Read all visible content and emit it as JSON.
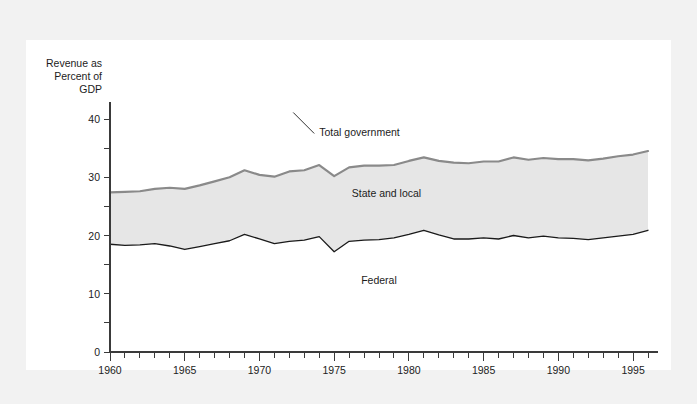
{
  "chart_data": {
    "type": "area",
    "title": "",
    "xlabel": "",
    "ylabel": "Revenue as Percent of GDP",
    "ylabel_lines": [
      "Revenue as",
      "Percent of",
      "GDP"
    ],
    "xlim": [
      1960,
      1996
    ],
    "ylim": [
      0,
      43
    ],
    "grid": false,
    "legend_position": "inline-annotations",
    "y_ticks_major": [
      0,
      10,
      20,
      30,
      40
    ],
    "y_ticks_minor": [
      5,
      15,
      25,
      35
    ],
    "y_tick_labels": [
      "0",
      "10",
      "20",
      "30",
      "40"
    ],
    "x_ticks_major": [
      1960,
      1965,
      1970,
      1975,
      1980,
      1985,
      1990,
      1995
    ],
    "x_tick_labels": [
      "1960",
      "1965",
      "1970",
      "1975",
      "1980",
      "1985",
      "1990",
      "1995"
    ],
    "x_ticks_minor_step": 1,
    "annotations": [
      {
        "text": "Total government",
        "x": 1974.0,
        "y": 37.0
      },
      {
        "text": "State and local",
        "x": 1978.5,
        "y": 26.6
      },
      {
        "text": "Federal",
        "x": 1978.0,
        "y": 11.6
      }
    ],
    "x": [
      1960,
      1961,
      1962,
      1963,
      1964,
      1965,
      1966,
      1967,
      1968,
      1969,
      1970,
      1971,
      1972,
      1973,
      1974,
      1975,
      1976,
      1977,
      1978,
      1979,
      1980,
      1981,
      1982,
      1983,
      1984,
      1985,
      1986,
      1987,
      1988,
      1989,
      1990,
      1991,
      1992,
      1993,
      1994,
      1995,
      1996
    ],
    "series": [
      {
        "name": "Total government",
        "color": "#8a8a8a",
        "values": [
          27.4,
          27.5,
          27.6,
          28.0,
          28.2,
          28.0,
          28.6,
          29.3,
          30.0,
          31.2,
          30.4,
          30.1,
          31.0,
          31.2,
          32.1,
          30.2,
          31.7,
          32.0,
          32.0,
          32.1,
          32.8,
          33.4,
          32.8,
          32.5,
          32.4,
          32.7,
          32.7,
          33.4,
          33.0,
          33.3,
          33.1,
          33.1,
          32.9,
          33.2,
          33.6,
          33.9,
          34.5
        ]
      },
      {
        "name": "Federal",
        "color": "#1a1a1a",
        "values": [
          18.5,
          18.3,
          18.4,
          18.6,
          18.2,
          17.6,
          18.1,
          18.6,
          19.1,
          20.2,
          19.4,
          18.6,
          19.0,
          19.2,
          19.8,
          17.2,
          19.0,
          19.2,
          19.3,
          19.6,
          20.2,
          20.9,
          20.1,
          19.4,
          19.4,
          19.6,
          19.4,
          20.0,
          19.6,
          19.9,
          19.6,
          19.5,
          19.3,
          19.6,
          19.9,
          20.2,
          20.9
        ]
      }
    ],
    "derived_series": [
      {
        "name": "State and local",
        "description": "Shaded band between Federal and Total government",
        "fill_color": "#e6e6e6"
      }
    ]
  },
  "figure": {
    "background_color": "#f2f2f2",
    "panel_color": "#ffffff",
    "axis_color": "#3a3a3a"
  }
}
